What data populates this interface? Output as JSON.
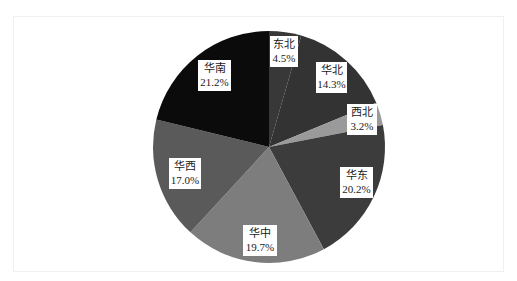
{
  "chart_data": {
    "type": "pie",
    "title": "",
    "start_angle_deg": 0,
    "direction": "clockwise",
    "categories": [
      "东北",
      "华北",
      "西北",
      "华东",
      "华中",
      "华西",
      "华南"
    ],
    "values": [
      4.5,
      14.3,
      3.2,
      20.2,
      19.7,
      17.0,
      21.2
    ],
    "labels": [
      "4.5%",
      "14.3%",
      "3.2%",
      "20.2%",
      "19.7%",
      "17.0%",
      "21.2%"
    ],
    "colors": [
      "#383838",
      "#333333",
      "#9a9a9a",
      "#3c3c3c",
      "#7d7d7d",
      "#5a5a5a",
      "#0b0b0b"
    ],
    "legend": "none",
    "data_labels": "inside, category name and percentage"
  },
  "slices": [
    {
      "name": "东北",
      "pct": "4.5%"
    },
    {
      "name": "华北",
      "pct": "14.3%"
    },
    {
      "name": "西北",
      "pct": "3.2%"
    },
    {
      "name": "华东",
      "pct": "20.2%"
    },
    {
      "name": "华中",
      "pct": "19.7%"
    },
    {
      "name": "华西",
      "pct": "17.0%"
    },
    {
      "name": "华南",
      "pct": "21.2%"
    }
  ]
}
